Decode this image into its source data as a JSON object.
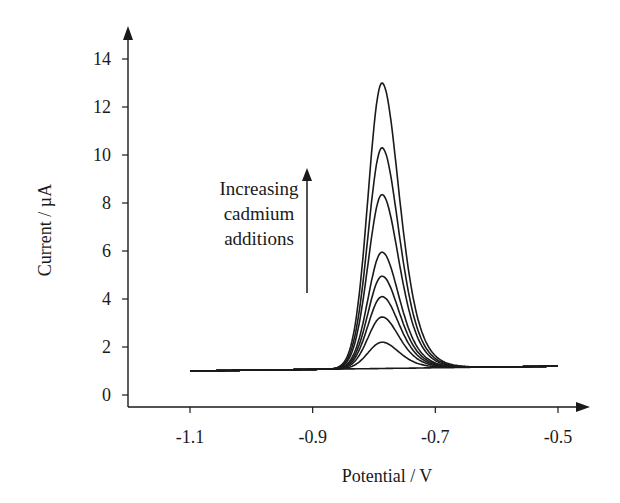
{
  "chart_data": {
    "type": "line",
    "title": "",
    "xlabel": "Potential / V",
    "ylabel": "Current / µA",
    "xlim": [
      -1.2,
      -0.45
    ],
    "ylim": [
      0,
      14.8
    ],
    "x_ticks": [
      -1.1,
      -0.9,
      -0.7,
      -0.5
    ],
    "x_tick_labels": [
      "-1.1",
      "-0.9",
      "-0.7",
      "-0.5"
    ],
    "y_ticks": [
      0,
      2,
      4,
      6,
      8,
      10,
      12,
      14
    ],
    "y_tick_labels": [
      "0",
      "2",
      "4",
      "6",
      "8",
      "10",
      "12",
      "14"
    ],
    "grid": false,
    "legend": null,
    "x_range_plotted": [
      -1.1,
      -0.5
    ],
    "peak_potential": -0.787,
    "baseline_start": 1.0,
    "baseline_end": 1.2,
    "series": [
      {
        "name": "blank",
        "peak_current": 1.1
      },
      {
        "name": "addition 1",
        "peak_current": 2.2
      },
      {
        "name": "addition 2",
        "peak_current": 3.25
      },
      {
        "name": "addition 3",
        "peak_current": 4.1
      },
      {
        "name": "addition 4",
        "peak_current": 4.95
      },
      {
        "name": "addition 5",
        "peak_current": 5.95
      },
      {
        "name": "addition 6",
        "peak_current": 8.35
      },
      {
        "name": "addition 7",
        "peak_current": 10.3
      },
      {
        "name": "addition 8",
        "peak_current": 13.0
      }
    ],
    "annotations": [
      {
        "text_lines": [
          "Increasing",
          "cadmium",
          "additions"
        ],
        "arrow": "up"
      }
    ]
  },
  "annotation": {
    "line1": "Increasing",
    "line2": "cadmium",
    "line3": "additions"
  },
  "style": {
    "line_color": "#1a1a1a",
    "background": "#ffffff"
  }
}
